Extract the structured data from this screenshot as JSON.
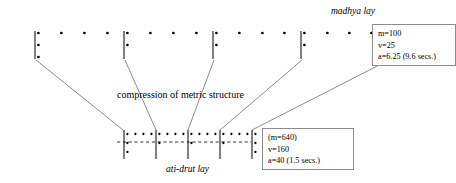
{
  "figure": {
    "type": "music-metric-diagram",
    "background": "#ffffff",
    "ink_color": "#000000",
    "line_color": "#6f6f6f",
    "box_border_color": "#8d8d8d"
  },
  "labels": {
    "madhya_lay": "madhya lay",
    "ati_drut_lay": "ati-drut lay",
    "compression": "compression of metric structure"
  },
  "boxes": {
    "madhya": {
      "lines": [
        "m=100",
        "v=25",
        "a=6.25 (9.6 secs.)"
      ]
    },
    "ati_drut": {
      "lines": [
        "(m=640)",
        "v=160",
        "a=40 (1.5 secs.)"
      ]
    }
  },
  "chart_data": {
    "type": "diagram",
    "title": "compression of metric structure",
    "staves": [
      {
        "name": "madhya lay",
        "y_top": 31,
        "dot_row_y": 33,
        "barline_top": 31,
        "barline_bottom": 59,
        "groups": [
          {
            "barline_x": 35,
            "barline_dots": 3,
            "dots_x": [
              35,
              58,
              81,
              104
            ]
          },
          {
            "barline_x": 124,
            "barline_dots": 2,
            "dots_x": [
              124,
              147,
              170,
              193
            ]
          },
          {
            "barline_x": 213,
            "barline_dots": 2,
            "dots_x": [
              213,
              236,
              259,
              281
            ]
          },
          {
            "barline_x": 301,
            "barline_dots": 2,
            "dots_x": [
              301,
              324,
              346,
              368
            ]
          }
        ],
        "end_barline": {
          "barline_x": 388,
          "barline_dots": 3
        }
      },
      {
        "name": "ati-drut lay",
        "dot_row_y": 134,
        "barline_top": 130,
        "barline_bottom": 159,
        "dashed_line_y": 142,
        "dashed_line_x1": 117,
        "dashed_line_x2": 251,
        "groups": [
          {
            "barline_x": 124,
            "barline_dots": 3,
            "dots_x": [
              124,
              132,
              140,
              148
            ]
          },
          {
            "barline_x": 156,
            "barline_dots": 2,
            "dots_x": [
              156,
              164,
              172,
              180
            ]
          },
          {
            "barline_x": 188,
            "barline_dots": 2,
            "dots_x": [
              188,
              196,
              204,
              212
            ]
          },
          {
            "barline_x": 220,
            "barline_dots": 2,
            "dots_x": [
              220,
              228,
              236,
              244
            ]
          }
        ],
        "end_barline": {
          "barline_x": 252,
          "barline_dots": 3
        }
      }
    ],
    "connectors": [
      {
        "from_x": 36,
        "from_y": 60,
        "to_x": 123,
        "to_y": 130
      },
      {
        "from_x": 125,
        "from_y": 60,
        "to_x": 156,
        "to_y": 130
      },
      {
        "from_x": 214,
        "from_y": 60,
        "to_x": 188,
        "to_y": 130
      },
      {
        "from_x": 302,
        "from_y": 60,
        "to_x": 220,
        "to_y": 130
      },
      {
        "from_x": 389,
        "from_y": 60,
        "to_x": 252,
        "to_y": 130
      }
    ],
    "values": {
      "madhya_m": 100,
      "madhya_v": 25,
      "madhya_a": 6.25,
      "madhya_secs": 9.6,
      "atidrut_m": 640,
      "atidrut_v": 160,
      "atidrut_a": 40,
      "atidrut_secs": 1.5
    }
  }
}
